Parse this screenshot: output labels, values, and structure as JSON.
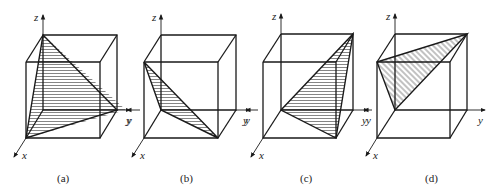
{
  "figure": {
    "panels": [
      {
        "caption": "(a)",
        "axes": {
          "z": "z",
          "y": "y",
          "x": "x"
        },
        "hatch": "horizontal",
        "description": "Triangle plane through top of z-axis, far y-axis corner, and front-bottom x corner"
      },
      {
        "caption": "(b)",
        "axes": {
          "z": "z",
          "y_left": "y",
          "y": "y",
          "x": "x"
        },
        "hatch": "horizontal",
        "description": "Triangle plane through front-top-left, origin, and front-bottom-right"
      },
      {
        "caption": "(c)",
        "axes": {
          "z": "z",
          "y_left": "y",
          "y": "y",
          "x": "x"
        },
        "hatch": "horizontal",
        "description": "Triangle plane through origin, back-top-right, and front-bottom-right"
      },
      {
        "caption": "(d)",
        "axes": {
          "z": "z",
          "y_left": "y",
          "y": "y",
          "x": "x"
        },
        "hatch": "diagonal",
        "description": "Triangle plane through front-top-left, back-top-right, and origin"
      }
    ]
  }
}
